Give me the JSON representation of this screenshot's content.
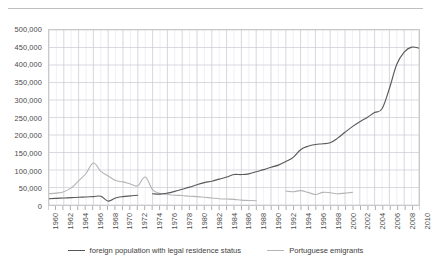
{
  "chart_data": {
    "type": "line",
    "title": "",
    "xlabel": "",
    "ylabel": "",
    "xlim": [
      1960,
      2010
    ],
    "ylim": [
      0,
      500000
    ],
    "ytick_step": 50000,
    "xtick_step": 2,
    "grid": true,
    "legend_position": "bottom",
    "ytick_labels": [
      "0",
      "50,000",
      "100,000",
      "150,000",
      "200,000",
      "250,000",
      "300,000",
      "350,000",
      "400,000",
      "450,000",
      "500,000"
    ],
    "ytick_values": [
      0,
      50000,
      100000,
      150000,
      200000,
      250000,
      300000,
      350000,
      400000,
      450000,
      500000
    ],
    "xtick_labels": [
      "1960",
      "1962",
      "1964",
      "1966",
      "1968",
      "1970",
      "1972",
      "1974",
      "1976",
      "1978",
      "1980",
      "1982",
      "1984",
      "1986",
      "1988",
      "1990",
      "1992",
      "1994",
      "1996",
      "1998",
      "2000",
      "2002",
      "2004",
      "2006",
      "2008",
      "2010"
    ],
    "xtick_values": [
      1960,
      1962,
      1964,
      1966,
      1968,
      1970,
      1972,
      1974,
      1976,
      1978,
      1980,
      1982,
      1984,
      1986,
      1988,
      1990,
      1992,
      1994,
      1996,
      1998,
      2000,
      2002,
      2004,
      2006,
      2008,
      2010
    ],
    "series": [
      {
        "name": "foreign population with legal residence status",
        "color": "#5a5a5a",
        "segments": [
          {
            "x": [
              1960,
              1961,
              1962,
              1963,
              1964,
              1965,
              1966,
              1967,
              1968,
              1969,
              1970,
              1971,
              1972
            ],
            "y": [
              18000,
              19000,
              20000,
              21000,
              22000,
              23000,
              24000,
              25000,
              11000,
              20000,
              24000,
              26000,
              28000
            ]
          },
          {
            "x": [
              1974,
              1975,
              1976,
              1977,
              1978,
              1979,
              1980,
              1981,
              1982,
              1983,
              1984,
              1985,
              1986,
              1987,
              1988,
              1989,
              1990,
              1991,
              1992,
              1993,
              1994,
              1995,
              1996,
              1997,
              1998,
              1999,
              2000,
              2001,
              2002,
              2003,
              2004,
              2005,
              2006,
              2007,
              2008,
              2009,
              2010
            ],
            "y": [
              32000,
              31000,
              34000,
              39000,
              45000,
              51000,
              58000,
              64000,
              68000,
              74000,
              80000,
              87000,
              87000,
              89000,
              95000,
              101000,
              108000,
              114000,
              124000,
              136000,
              158000,
              168000,
              173000,
              175000,
              178000,
              191000,
              208000,
              224000,
              238000,
              250000,
              264000,
              275000,
              333000,
              402000,
              437000,
              451000,
              448000
            ]
          }
        ]
      },
      {
        "name": "Portuguese emigrants",
        "color": "#b4b4b4",
        "segments": [
          {
            "x": [
              1960,
              1961,
              1962,
              1963,
              1964,
              1965,
              1966,
              1967,
              1968,
              1969,
              1970,
              1971,
              1972,
              1973,
              1974,
              1975,
              1976,
              1977,
              1978,
              1979,
              1980,
              1981,
              1982,
              1983,
              1984,
              1985,
              1986,
              1987,
              1988
            ],
            "y": [
              32000,
              34000,
              38000,
              49000,
              69000,
              90000,
              120000,
              96000,
              83000,
              70000,
              66000,
              60000,
              55000,
              80000,
              44000,
              33000,
              30000,
              28000,
              27000,
              25000,
              24000,
              22000,
              20000,
              18000,
              17000,
              16000,
              14000,
              13000,
              12000
            ]
          },
          {
            "x": [
              1992,
              1993,
              1994,
              1995,
              1996,
              1997,
              1998,
              1999,
              2000,
              2001
            ],
            "y": [
              40000,
              38000,
              41000,
              36000,
              30000,
              36000,
              35000,
              32000,
              34000,
              36000
            ]
          }
        ]
      }
    ]
  },
  "legend": {
    "items": [
      {
        "label": "foreign population with legal residence status"
      },
      {
        "label": "Portuguese emigrants"
      }
    ]
  }
}
